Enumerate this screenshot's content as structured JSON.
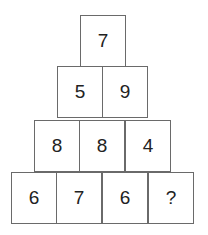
{
  "pyramid": {
    "rows": [
      [
        "7"
      ],
      [
        "5",
        "9"
      ],
      [
        "8",
        "8",
        "4"
      ],
      [
        "6",
        "7",
        "6",
        "?"
      ]
    ]
  }
}
